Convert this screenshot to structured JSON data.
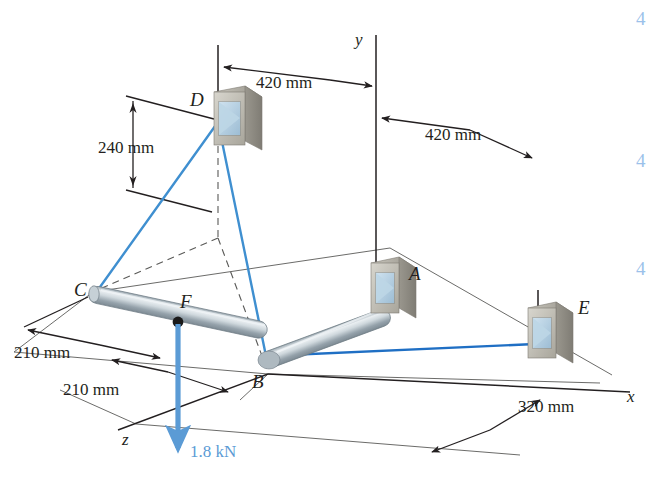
{
  "figure": {
    "type": "engineering-statics-free-body-diagram",
    "axes": {
      "x_label": "x",
      "y_label": "y",
      "z_label": "z"
    },
    "points": [
      {
        "id": "A",
        "label": "A",
        "support": "bracket"
      },
      {
        "id": "B",
        "label": "B",
        "support": "rod-bend"
      },
      {
        "id": "C",
        "label": "C",
        "support": "rod-end"
      },
      {
        "id": "D",
        "label": "D",
        "support": "bracket"
      },
      {
        "id": "E",
        "label": "E",
        "support": "bracket"
      },
      {
        "id": "F",
        "label": "F",
        "support": "load-point"
      }
    ],
    "dimensions": [
      {
        "id": "dim-420-left",
        "value": "420 mm"
      },
      {
        "id": "dim-420-right",
        "value": "420 mm"
      },
      {
        "id": "dim-240",
        "value": "240 mm"
      },
      {
        "id": "dim-210-upper",
        "value": "210 mm"
      },
      {
        "id": "dim-210-lower",
        "value": "210 mm"
      },
      {
        "id": "dim-320",
        "value": "320 mm"
      }
    ],
    "load": {
      "label": "1.8 kN",
      "direction": "downward",
      "applied_at": "F",
      "color": "#5b9bd5"
    },
    "cables": [
      {
        "id": "cable-DC",
        "from": "D",
        "to": "C",
        "color": "#3f8fd0"
      },
      {
        "id": "cable-DB",
        "from": "D",
        "to": "B",
        "color": "#3f8fd0"
      },
      {
        "id": "cable-BE",
        "from": "B",
        "to": "E",
        "color": "#1f6fc4"
      }
    ],
    "colors": {
      "cable": "#3f8fd0",
      "load_arrow": "#5b9bd5",
      "rod_metal": "#b8c4cb",
      "bracket_gray": "#b3b0a8",
      "line_black": "#231f20"
    },
    "edge_marks": [
      {
        "glyph": "4"
      },
      {
        "glyph": "4"
      },
      {
        "glyph": "4"
      }
    ]
  }
}
